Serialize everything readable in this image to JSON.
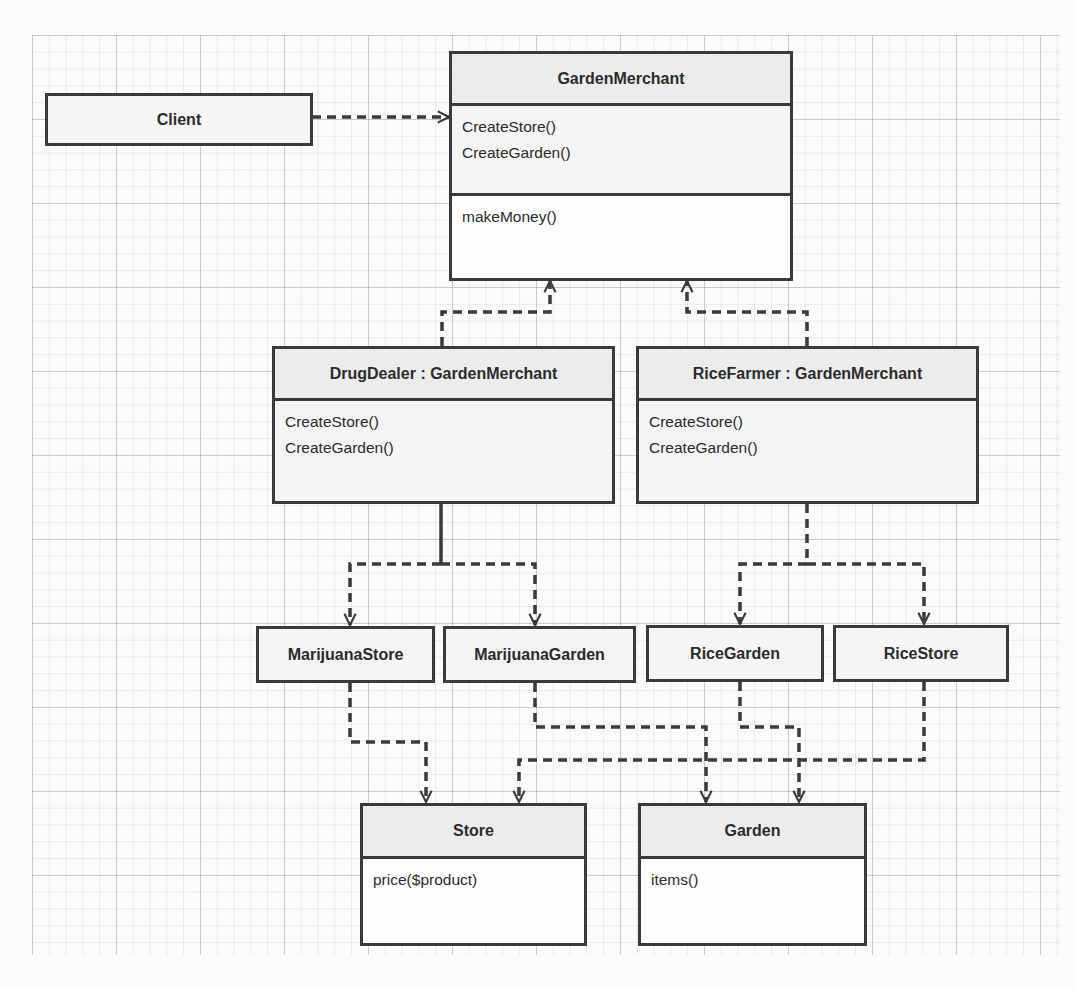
{
  "diagram": {
    "type": "uml-class-diagram",
    "classes": {
      "client": {
        "name": "Client"
      },
      "garden_merchant": {
        "name": "GardenMerchant",
        "abstract_methods": [
          "CreateStore()",
          "CreateGarden()"
        ],
        "methods": [
          "makeMoney()"
        ]
      },
      "drug_dealer": {
        "name": "DrugDealer : GardenMerchant",
        "methods": [
          "CreateStore()",
          "CreateGarden()"
        ]
      },
      "rice_farmer": {
        "name": "RiceFarmer : GardenMerchant",
        "methods": [
          "CreateStore()",
          "CreateGarden()"
        ]
      },
      "marijuana_store": {
        "name": "MarijuanaStore"
      },
      "marijuana_garden": {
        "name": "MarijuanaGarden"
      },
      "rice_garden": {
        "name": "RiceGarden"
      },
      "rice_store": {
        "name": "RiceStore"
      },
      "store": {
        "name": "Store",
        "methods": [
          "price($product)"
        ]
      },
      "garden": {
        "name": "Garden",
        "methods": [
          "items()"
        ]
      }
    },
    "relationships": [
      {
        "from": "Client",
        "to": "GardenMerchant",
        "style": "dashed",
        "arrow": "open"
      },
      {
        "from": "DrugDealer : GardenMerchant",
        "to": "GardenMerchant",
        "style": "dashed",
        "arrow": "open"
      },
      {
        "from": "RiceFarmer : GardenMerchant",
        "to": "GardenMerchant",
        "style": "dashed",
        "arrow": "open"
      },
      {
        "from": "DrugDealer : GardenMerchant",
        "to": "MarijuanaStore",
        "style": "dashed",
        "arrow": "open"
      },
      {
        "from": "DrugDealer : GardenMerchant",
        "to": "MarijuanaGarden",
        "style": "dashed",
        "arrow": "open"
      },
      {
        "from": "RiceFarmer : GardenMerchant",
        "to": "RiceGarden",
        "style": "dashed",
        "arrow": "open"
      },
      {
        "from": "RiceFarmer : GardenMerchant",
        "to": "RiceStore",
        "style": "dashed",
        "arrow": "open"
      },
      {
        "from": "MarijuanaStore",
        "to": "Store",
        "style": "dashed",
        "arrow": "open"
      },
      {
        "from": "RiceStore",
        "to": "Store",
        "style": "dashed",
        "arrow": "open"
      },
      {
        "from": "MarijuanaGarden",
        "to": "Garden",
        "style": "dashed",
        "arrow": "open"
      },
      {
        "from": "RiceGarden",
        "to": "Garden",
        "style": "dashed",
        "arrow": "open"
      }
    ],
    "colors": {
      "line": "#3a3a3a",
      "header_fill": "#ececec",
      "box_fill": "#f7f7f7",
      "grid": "#9a9a9a"
    }
  }
}
